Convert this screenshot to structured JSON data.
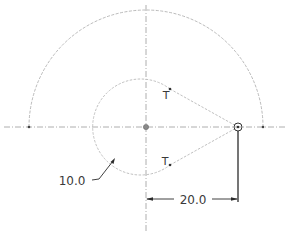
{
  "drawing": {
    "dimensions": {
      "radius_small": "10.0",
      "distance": "20.0"
    },
    "tangent_labels": {
      "upper": "T",
      "lower": "T"
    },
    "colors": {
      "construction": "#a8a8a8",
      "geometry": "#b9b9b9",
      "dimension": "#2b2b2b",
      "text": "#3a3a3a"
    }
  }
}
